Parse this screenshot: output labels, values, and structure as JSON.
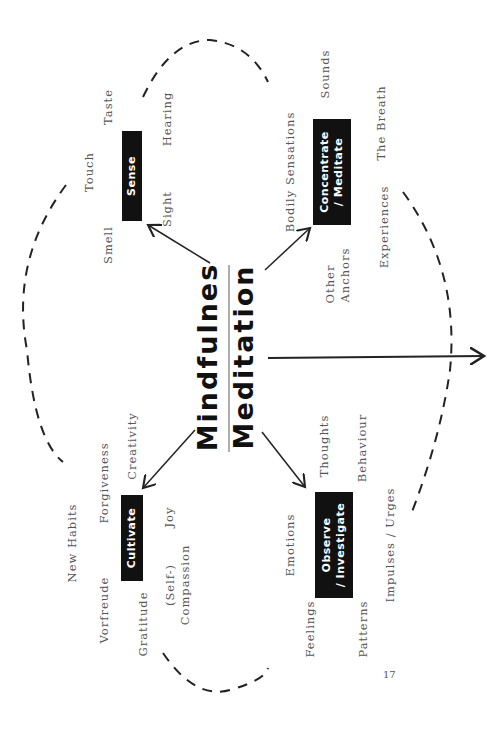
{
  "title": {
    "line1": "Mindfulnes",
    "line2": "Meditation"
  },
  "nodes": {
    "sense": "Sense",
    "concentrate_l1": "Concentrate",
    "concentrate_l2": "/ Meditate",
    "cultivate": "Cultivate",
    "observe_l1": "Observe",
    "observe_l2": "/ Investigate"
  },
  "sense_items": [
    "Taste",
    "Touch",
    "Hearing",
    "Sight",
    "Smell"
  ],
  "concentrate_items": [
    "Sounds",
    "Bodily Sensations",
    "The Breath",
    "Other",
    "Anchors",
    "Experiences"
  ],
  "cultivate_items": [
    "New Habits",
    "Forgiveness",
    "Creativity",
    "Joy",
    "Vorfreude",
    "Gratitude",
    "(Self-)",
    "Compassion"
  ],
  "observe_items": [
    "Emotions",
    "Thoughts",
    "Behaviour",
    "Feelings",
    "Patterns",
    "Impulses / Urges"
  ],
  "page_number": "17",
  "colors": {
    "box": "#111111",
    "text": "#555555",
    "line": "#222222"
  }
}
